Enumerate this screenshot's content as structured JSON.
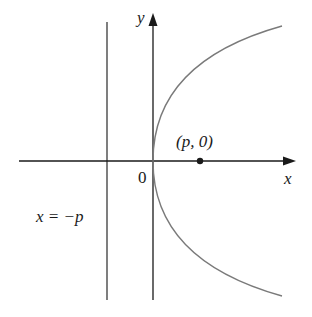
{
  "diagram": {
    "type": "parabola",
    "equation": "y^2 = 4px",
    "colors": {
      "axes": "#1a1a1a",
      "curve": "#7a7a7a",
      "directrix": "#3a3a3a",
      "background": "#ffffff"
    },
    "labels": {
      "y_axis": "y",
      "x_axis": "x",
      "origin": "0",
      "focus": "(p, 0)",
      "directrix": "x = −p"
    },
    "elements": [
      {
        "name": "x-axis",
        "kind": "arrow",
        "direction": "right"
      },
      {
        "name": "y-axis",
        "kind": "arrow",
        "direction": "up"
      },
      {
        "name": "parabola",
        "kind": "curve",
        "opens": "right",
        "vertex": "origin"
      },
      {
        "name": "focus-point",
        "kind": "point",
        "label": "(p, 0)"
      },
      {
        "name": "directrix-line",
        "kind": "vertical-line",
        "label": "x = −p"
      }
    ]
  }
}
